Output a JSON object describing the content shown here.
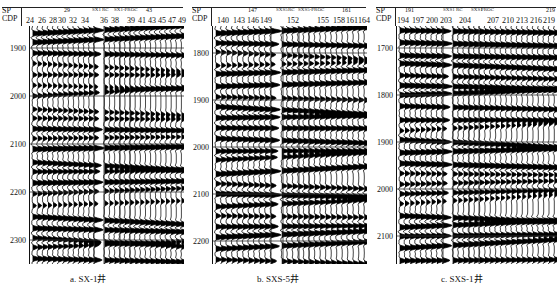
{
  "panels": [
    {
      "id": "a",
      "caption": "a. SX-1井",
      "header": {
        "sp_label": "SP",
        "cdp_label": "CDP",
        "sp_value": "29",
        "cdp_values": [
          "24",
          "26",
          "28",
          "30",
          "32",
          "34",
          "36",
          "38",
          "39",
          "41",
          "43",
          "45",
          "47",
          "49"
        ],
        "well_labels": [
          "SX1",
          "RC",
          "SX1-PROC"
        ],
        "sp_value_2": "43"
      },
      "y_ticks": [
        "1900",
        "2000",
        "2100",
        "2200",
        "2300"
      ]
    },
    {
      "id": "b",
      "caption": "b. SXS-5井",
      "header": {
        "sp_label": "SP",
        "cdp_label": "CDP",
        "sp_value": "147",
        "cdp_values": [
          "140",
          "143",
          "146",
          "149",
          "152",
          "155",
          "158",
          "161",
          "164"
        ],
        "well_labels": [
          "SXS5",
          "RC",
          "SXS5-PROC"
        ],
        "sp_value_2": "161"
      },
      "y_ticks": [
        "1800",
        "1900",
        "2000",
        "2100",
        "2200"
      ]
    },
    {
      "id": "c",
      "caption": "c. SXS-1井",
      "header": {
        "sp_label": "SP",
        "cdp_label": "CDP",
        "sp_value": "191",
        "cdp_values": [
          "194",
          "197",
          "200",
          "203",
          "204",
          "207",
          "210",
          "213",
          "216",
          "219"
        ],
        "well_labels": [
          "SXS1",
          "RC",
          "SXS1",
          "PROC"
        ],
        "sp_value_2": "219"
      },
      "y_ticks": [
        "1700",
        "1800",
        "1900",
        "2000",
        "2100"
      ]
    }
  ]
}
